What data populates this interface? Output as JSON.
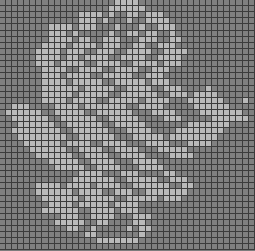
{
  "image": {
    "subject": "pixelated rose pattern on grid",
    "columns": 42,
    "rows": 41,
    "colors": {
      "background_cell": "#808080",
      "foreground_cell": "#b9b9b9",
      "grid_line": "#3c3c3c"
    },
    "lit_ranges": [
      [
        [
          19,
          22
        ]
      ],
      [
        [
          18,
          23
        ]
      ],
      [
        [
          13,
          16
        ],
        [
          18,
          18
        ],
        [
          21,
          22
        ],
        [
          24,
          26
        ]
      ],
      [
        [
          13,
          15
        ],
        [
          17,
          17
        ],
        [
          21,
          21
        ],
        [
          24,
          27
        ]
      ],
      [
        [
          8,
          11
        ],
        [
          13,
          15
        ],
        [
          19,
          19
        ],
        [
          23,
          23
        ],
        [
          26,
          28
        ]
      ],
      [
        [
          8,
          10
        ],
        [
          12,
          12
        ],
        [
          18,
          18
        ],
        [
          21,
          22
        ],
        [
          24,
          25
        ],
        [
          28,
          28
        ]
      ],
      [
        [
          8,
          11
        ],
        [
          13,
          14
        ],
        [
          17,
          19
        ],
        [
          23,
          25
        ],
        [
          28,
          29
        ]
      ],
      [
        [
          7,
          10
        ],
        [
          12,
          15
        ],
        [
          17,
          19
        ],
        [
          22,
          23
        ],
        [
          26,
          28
        ]
      ],
      [
        [
          6,
          9
        ],
        [
          11,
          13
        ],
        [
          16,
          18
        ],
        [
          21,
          24
        ],
        [
          27,
          30
        ]
      ],
      [
        [
          6,
          9
        ],
        [
          11,
          12
        ],
        [
          14,
          17
        ],
        [
          20,
          23
        ],
        [
          26,
          29
        ]
      ],
      [
        [
          6,
          8
        ],
        [
          10,
          13
        ],
        [
          16,
          19
        ],
        [
          22,
          25
        ],
        [
          27,
          29
        ]
      ],
      [
        [
          7,
          10
        ],
        [
          13,
          16
        ],
        [
          19,
          22
        ],
        [
          25,
          27
        ]
      ],
      [
        [
          7,
          9
        ],
        [
          11,
          14
        ],
        [
          17,
          21
        ],
        [
          24,
          26
        ]
      ],
      [
        [
          7,
          10
        ],
        [
          12,
          16
        ],
        [
          19,
          23
        ],
        [
          25,
          27
        ]
      ],
      [
        [
          7,
          12
        ],
        [
          14,
          18
        ],
        [
          21,
          24
        ],
        [
          27,
          29
        ],
        [
          34,
          34
        ]
      ],
      [
        [
          7,
          11
        ],
        [
          13,
          17
        ],
        [
          20,
          25
        ],
        [
          28,
          30
        ],
        [
          32,
          35
        ]
      ],
      [
        [
          7,
          10
        ],
        [
          12,
          15
        ],
        [
          18,
          22
        ],
        [
          24,
          27
        ],
        [
          31,
          36
        ],
        [
          40,
          40
        ]
      ],
      [
        [
          2,
          4
        ],
        [
          9,
          12
        ],
        [
          14,
          20
        ],
        [
          23,
          26
        ],
        [
          32,
          37
        ]
      ],
      [
        [
          1,
          6
        ],
        [
          9,
          13
        ],
        [
          16,
          21
        ],
        [
          25,
          28
        ],
        [
          33,
          39
        ]
      ],
      [
        [
          2,
          7
        ],
        [
          10,
          15
        ],
        [
          18,
          22
        ],
        [
          27,
          29
        ],
        [
          35,
          40
        ]
      ],
      [
        [
          3,
          8
        ],
        [
          11,
          16
        ],
        [
          19,
          23
        ],
        [
          31,
          37
        ]
      ],
      [
        [
          2,
          9
        ],
        [
          12,
          17
        ],
        [
          21,
          24
        ],
        [
          29,
          36
        ]
      ],
      [
        [
          3,
          10
        ],
        [
          13,
          18
        ],
        [
          22,
          26
        ],
        [
          28,
          35
        ]
      ],
      [
        [
          4,
          9
        ],
        [
          11,
          14
        ],
        [
          17,
          20
        ],
        [
          24,
          27
        ],
        [
          31,
          34
        ]
      ],
      [
        [
          5,
          10
        ],
        [
          13,
          16
        ],
        [
          19,
          22
        ],
        [
          26,
          30
        ]
      ],
      [
        [
          6,
          11
        ],
        [
          14,
          17
        ],
        [
          20,
          23
        ],
        [
          28,
          31
        ]
      ],
      [
        [
          8,
          12
        ],
        [
          15,
          18
        ],
        [
          22,
          25
        ]
      ],
      [
        [
          9,
          13
        ],
        [
          16,
          19
        ],
        [
          23,
          26
        ]
      ],
      [
        [
          13,
          16
        ],
        [
          20,
          22
        ],
        [
          27,
          28
        ]
      ],
      [
        [
          12,
          18
        ],
        [
          21,
          25
        ],
        [
          28,
          30
        ]
      ],
      [
        [
          6,
          9
        ],
        [
          11,
          14
        ],
        [
          16,
          19
        ],
        [
          22,
          27
        ],
        [
          30,
          31
        ]
      ],
      [
        [
          6,
          11
        ],
        [
          13,
          16
        ],
        [
          19,
          21
        ],
        [
          24,
          30
        ]
      ],
      [
        [
          7,
          12
        ],
        [
          14,
          18
        ],
        [
          21,
          25
        ],
        [
          27,
          29
        ]
      ],
      [
        [
          8,
          11
        ],
        [
          13,
          17
        ],
        [
          19,
          22
        ]
      ],
      [
        [
          7,
          12
        ],
        [
          15,
          18
        ],
        [
          20,
          22
        ]
      ],
      [
        [
          10,
          12
        ],
        [
          15,
          18
        ],
        [
          22,
          24
        ]
      ],
      [
        [
          9,
          13
        ],
        [
          16,
          17
        ],
        [
          22,
          23
        ]
      ],
      [
        [
          11,
          12
        ],
        [
          15,
          15
        ],
        [
          21,
          21
        ],
        [
          23,
          24
        ]
      ],
      [
        [
          14,
          15
        ],
        [
          23,
          23
        ]
      ],
      [
        [
          16,
          22
        ]
      ],
      []
    ]
  }
}
